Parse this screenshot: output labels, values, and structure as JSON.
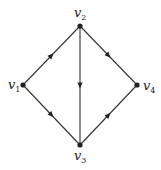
{
  "diagram": {
    "type": "directed-graph",
    "colors": {
      "edge": "#333333",
      "node": "#222222",
      "background": "#ffffff"
    },
    "vertices": [
      {
        "id": "v1",
        "base": "v",
        "sub": "1",
        "x": 23,
        "y": 85,
        "label_x": 8,
        "label_y": 89
      },
      {
        "id": "v2",
        "base": "v",
        "sub": "2",
        "x": 80,
        "y": 26,
        "label_x": 74,
        "label_y": 17
      },
      {
        "id": "v3",
        "base": "v",
        "sub": "3",
        "x": 80,
        "y": 145,
        "label_x": 74,
        "label_y": 160
      },
      {
        "id": "v4",
        "base": "v",
        "sub": "4",
        "x": 137,
        "y": 85,
        "label_x": 143,
        "label_y": 90
      }
    ],
    "edges": [
      {
        "from": "v1",
        "to": "v2"
      },
      {
        "from": "v2",
        "to": "v4"
      },
      {
        "from": "v2",
        "to": "v3"
      },
      {
        "from": "v1",
        "to": "v3"
      },
      {
        "from": "v3",
        "to": "v4"
      }
    ]
  }
}
